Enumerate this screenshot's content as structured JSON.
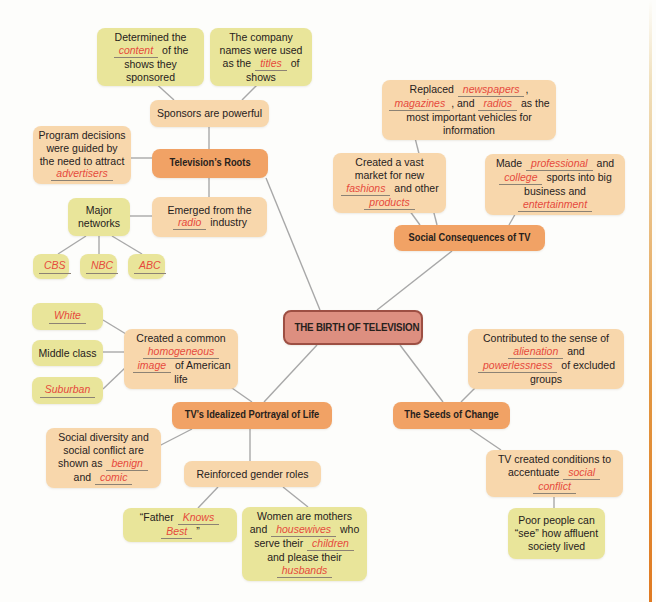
{
  "diagram": {
    "colors": {
      "background": "#fdfdfb",
      "yellow_node": "#e9e59a",
      "peach_node": "#f8d7ac",
      "branch_node": "#f1a265",
      "center_fill": "#dd8f80",
      "center_border": "#9d4f43",
      "blank_text": "#e64a3c",
      "underline": "#8c8274",
      "connector": "#a8a8a8",
      "page_edge": "#e07a22"
    },
    "nodes": [
      {
        "id": "determined-content",
        "type": "yellow",
        "x": 97,
        "y": 28,
        "w": 107,
        "h": 52,
        "segments": [
          {
            "t": "Determined the "
          },
          {
            "blank": "content"
          },
          {
            "t": " of the shows they sponsored"
          }
        ]
      },
      {
        "id": "company-names",
        "type": "yellow",
        "x": 210,
        "y": 28,
        "w": 102,
        "h": 52,
        "segments": [
          {
            "t": "The company names were used as the "
          },
          {
            "blank": "titles"
          },
          {
            "t": " of shows"
          }
        ]
      },
      {
        "id": "sponsors-powerful",
        "type": "peach",
        "x": 150,
        "y": 100,
        "w": 119,
        "h": 27,
        "segments": [
          {
            "t": "Sponsors are powerful"
          }
        ]
      },
      {
        "id": "program-decisions",
        "type": "peach",
        "x": 33,
        "y": 126,
        "w": 98,
        "h": 57,
        "segments": [
          {
            "t": "Program decisions were guided by the need to attract "
          },
          {
            "blank": "advertisers"
          }
        ]
      },
      {
        "id": "televisions-roots",
        "type": "branch",
        "x": 152,
        "y": 149,
        "w": 116,
        "h": 29,
        "segments": [
          {
            "t": "Television’s Roots"
          }
        ]
      },
      {
        "id": "major-networks",
        "type": "yellow",
        "x": 68,
        "y": 198,
        "w": 62,
        "h": 38,
        "segments": [
          {
            "t": "Major networks"
          }
        ]
      },
      {
        "id": "emerged-radio",
        "type": "peach",
        "x": 152,
        "y": 197,
        "w": 115,
        "h": 40,
        "segments": [
          {
            "t": "Emerged from the "
          },
          {
            "blank": "radio"
          },
          {
            "t": " industry"
          }
        ]
      },
      {
        "id": "cbs",
        "type": "yellow",
        "x": 33,
        "y": 254,
        "w": 36,
        "h": 25,
        "segments": [
          {
            "blank": "CBS"
          }
        ]
      },
      {
        "id": "nbc",
        "type": "yellow",
        "x": 80,
        "y": 254,
        "w": 37,
        "h": 25,
        "segments": [
          {
            "blank": "NBC"
          }
        ]
      },
      {
        "id": "abc",
        "type": "yellow",
        "x": 128,
        "y": 254,
        "w": 37,
        "h": 25,
        "segments": [
          {
            "blank": "ABC"
          }
        ]
      },
      {
        "id": "white",
        "type": "yellow",
        "x": 32,
        "y": 303,
        "w": 71,
        "h": 27,
        "segments": [
          {
            "blank": "White"
          }
        ]
      },
      {
        "id": "middle-class",
        "type": "yellow",
        "x": 32,
        "y": 340,
        "w": 71,
        "h": 26,
        "segments": [
          {
            "t": "Middle class"
          }
        ]
      },
      {
        "id": "suburban",
        "type": "yellow",
        "x": 32,
        "y": 377,
        "w": 71,
        "h": 27,
        "segments": [
          {
            "blank": "Suburban"
          }
        ]
      },
      {
        "id": "homogeneous-image",
        "type": "peach",
        "x": 124,
        "y": 329,
        "w": 114,
        "h": 50,
        "segments": [
          {
            "t": "Created a common "
          },
          {
            "blank": "homogeneous"
          },
          {
            "t": " "
          },
          {
            "blank": "image"
          },
          {
            "t": " of American life"
          }
        ]
      },
      {
        "id": "birth-of-television",
        "type": "center",
        "x": 283,
        "y": 310,
        "w": 140,
        "h": 35,
        "segments": [
          {
            "t": "THE BIRTH OF TELEVISION"
          }
        ]
      },
      {
        "id": "idealized-portrayal",
        "type": "branch",
        "x": 172,
        "y": 402,
        "w": 160,
        "h": 27,
        "segments": [
          {
            "t": "TV’s Idealized Portrayal of Life"
          }
        ]
      },
      {
        "id": "seeds-of-change",
        "type": "branch",
        "x": 393,
        "y": 402,
        "w": 117,
        "h": 27,
        "segments": [
          {
            "t": "The Seeds of Change"
          }
        ]
      },
      {
        "id": "social-diversity",
        "type": "peach",
        "x": 46,
        "y": 428,
        "w": 115,
        "h": 60,
        "segments": [
          {
            "t": "Social diversity and social conflict are shown as "
          },
          {
            "blank": "benign"
          },
          {
            "t": " and "
          },
          {
            "blank": "comic"
          }
        ]
      },
      {
        "id": "gender-roles",
        "type": "peach",
        "x": 184,
        "y": 461,
        "w": 137,
        "h": 26,
        "segments": [
          {
            "t": "Reinforced gender roles"
          }
        ]
      },
      {
        "id": "father-knows-best",
        "type": "yellow",
        "x": 123,
        "y": 508,
        "w": 114,
        "h": 27,
        "segments": [
          {
            "t": "“Father "
          },
          {
            "blank": "Knows"
          },
          {
            "t": " "
          },
          {
            "blank": "Best"
          },
          {
            "t": " ”"
          }
        ]
      },
      {
        "id": "women-mothers",
        "type": "yellow",
        "x": 242,
        "y": 507,
        "w": 125,
        "h": 65,
        "segments": [
          {
            "t": "Women are mothers and "
          },
          {
            "blank": "housewives"
          },
          {
            "t": " who serve their "
          },
          {
            "blank": "children"
          },
          {
            "t": " and please their "
          },
          {
            "blank": "husbands"
          }
        ]
      },
      {
        "id": "replaced-media",
        "type": "peach",
        "x": 382,
        "y": 80,
        "w": 174,
        "h": 50,
        "segments": [
          {
            "t": "Replaced "
          },
          {
            "blank": "newspapers"
          },
          {
            "t": ", "
          },
          {
            "blank": "magazines"
          },
          {
            "t": ", and "
          },
          {
            "blank": "radios"
          },
          {
            "t": " as the most important vehicles for information"
          }
        ]
      },
      {
        "id": "vast-market",
        "type": "peach",
        "x": 333,
        "y": 153,
        "w": 113,
        "h": 50,
        "segments": [
          {
            "t": "Created a vast market for new "
          },
          {
            "blank": "fashions"
          },
          {
            "t": " and other "
          },
          {
            "blank": "products"
          }
        ]
      },
      {
        "id": "made-sports",
        "type": "peach",
        "x": 485,
        "y": 154,
        "w": 140,
        "h": 50,
        "segments": [
          {
            "t": "Made "
          },
          {
            "blank": "professional"
          },
          {
            "t": " and "
          },
          {
            "blank": "college"
          },
          {
            "t": " sports into big business and "
          },
          {
            "blank": "entertainment"
          }
        ]
      },
      {
        "id": "social-consequences",
        "type": "branch",
        "x": 394,
        "y": 225,
        "w": 151,
        "h": 26,
        "segments": [
          {
            "t": "Social Consequences of TV"
          }
        ]
      },
      {
        "id": "contributed-alienation",
        "type": "peach",
        "x": 468,
        "y": 329,
        "w": 156,
        "h": 52,
        "segments": [
          {
            "t": "Contributed to the sense of "
          },
          {
            "blank": "alienation"
          },
          {
            "t": " and "
          },
          {
            "blank": "powerlessness"
          },
          {
            "t": " of excluded groups"
          }
        ]
      },
      {
        "id": "tv-conditions",
        "type": "peach",
        "x": 486,
        "y": 450,
        "w": 137,
        "h": 40,
        "segments": [
          {
            "t": "TV created conditions to accentuate "
          },
          {
            "blank": "social"
          },
          {
            "t": " "
          },
          {
            "blank": "conflict"
          }
        ]
      },
      {
        "id": "poor-people",
        "type": "yellow",
        "x": 508,
        "y": 508,
        "w": 97,
        "h": 51,
        "segments": [
          {
            "t": "Poor people can “see” how affluent society lived"
          }
        ]
      }
    ],
    "connectors": [
      [
        152,
        80,
        174,
        100
      ],
      [
        262,
        80,
        242,
        100
      ],
      [
        209,
        127,
        209,
        149
      ],
      [
        131,
        158,
        152,
        158
      ],
      [
        209,
        178,
        209,
        197
      ],
      [
        130,
        216,
        152,
        216
      ],
      [
        86,
        236,
        58,
        254
      ],
      [
        99,
        236,
        99,
        254
      ],
      [
        112,
        236,
        142,
        254
      ],
      [
        266,
        178,
        320,
        310
      ],
      [
        377,
        310,
        452,
        251
      ],
      [
        413,
        130,
        437,
        225
      ],
      [
        404,
        203,
        420,
        225
      ],
      [
        521,
        204,
        509,
        225
      ],
      [
        103,
        320,
        126,
        334
      ],
      [
        103,
        352,
        124,
        352
      ],
      [
        103,
        389,
        126,
        367
      ],
      [
        219,
        379,
        252,
        402
      ],
      [
        317,
        345,
        264,
        402
      ],
      [
        400,
        345,
        443,
        402
      ],
      [
        461,
        402,
        482,
        381
      ],
      [
        470,
        429,
        501,
        450
      ],
      [
        554,
        490,
        554,
        508
      ],
      [
        192,
        429,
        157,
        447
      ],
      [
        250,
        429,
        250,
        461
      ],
      [
        218,
        487,
        198,
        508
      ],
      [
        283,
        487,
        308,
        507
      ]
    ]
  }
}
